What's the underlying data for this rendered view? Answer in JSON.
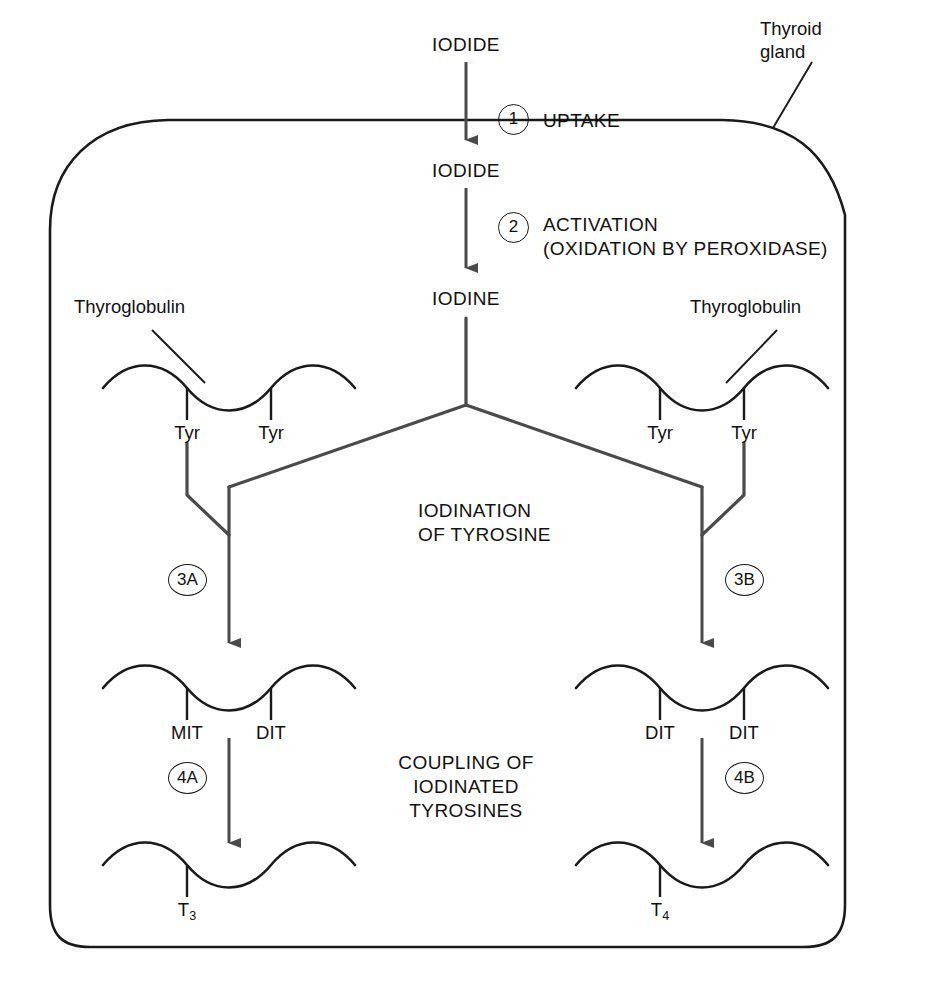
{
  "figure": {
    "gland_label": "Thyroid\ngland",
    "gland_label_line1": "Thyroid",
    "gland_label_line2": "gland",
    "caption": ""
  },
  "colors": {
    "outline": "#1a1a1a",
    "arrow": "#4a4a4a",
    "text": "#111111",
    "background": "#ffffff"
  },
  "substrates": {
    "iodide_outside": "IODIDE",
    "iodide_inside": "IODIDE",
    "iodine": "IODINE"
  },
  "steps": [
    {
      "id": "1",
      "number": "1",
      "label": "UPTAKE",
      "sublabel": ""
    },
    {
      "id": "2",
      "number": "2",
      "label": "ACTIVATION",
      "sublabel": "(OXIDATION BY PEROXIDASE)"
    },
    {
      "id": "3A",
      "number": "3A",
      "label": "",
      "sublabel": ""
    },
    {
      "id": "3B",
      "number": "3B",
      "label": "",
      "sublabel": ""
    },
    {
      "id": "4A",
      "number": "4A",
      "label": "",
      "sublabel": ""
    },
    {
      "id": "4B",
      "number": "4B",
      "label": "",
      "sublabel": ""
    }
  ],
  "process_labels": {
    "iodination_line1": "IODINATION",
    "iodination_line2": "OF TYROSINE",
    "coupling_line1": "COUPLING OF",
    "coupling_line2": "IODINATED",
    "coupling_line3": "TYROSINES"
  },
  "chains": {
    "left_top": {
      "callout": "Thyroglobulin",
      "residues": [
        "Tyr",
        "Tyr"
      ]
    },
    "right_top": {
      "callout": "Thyroglobulin",
      "residues": [
        "Tyr",
        "Tyr"
      ]
    },
    "left_mid": {
      "callout": "",
      "residues": [
        "MIT",
        "DIT"
      ]
    },
    "right_mid": {
      "callout": "",
      "residues": [
        "DIT",
        "DIT"
      ]
    },
    "left_bottom": {
      "callout": "",
      "residues": [
        "T3"
      ],
      "residue_base": "T",
      "residue_sub": "3"
    },
    "right_bottom": {
      "callout": "",
      "residues": [
        "T4"
      ],
      "residue_base": "T",
      "residue_sub": "4"
    }
  }
}
